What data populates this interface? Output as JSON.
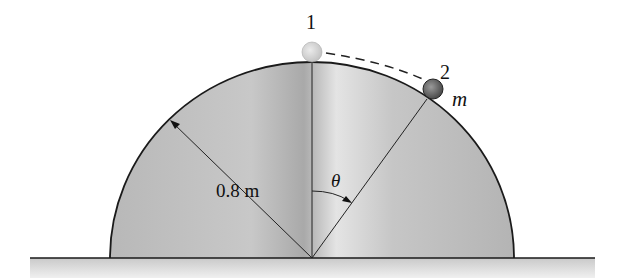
{
  "diagram": {
    "type": "physics-free-body",
    "labels": {
      "position1": "1",
      "position2": "2",
      "mass": "m",
      "radius": "0.8 m",
      "angle": "θ"
    },
    "colors": {
      "dome_fill": "#bdbdbd",
      "dome_highlight": "#e6e6e6",
      "ground": "#d9d9d9",
      "ball1": "#d8d8d8",
      "ball2": "#6e6e6e",
      "stroke": "#1a1a1a"
    }
  }
}
